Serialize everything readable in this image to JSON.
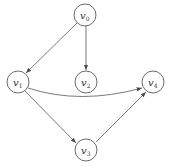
{
  "diagram": {
    "type": "directed-graph",
    "nodes": [
      {
        "id": "v0",
        "base": "v",
        "sub": "0",
        "cx": 85,
        "cy": 15
      },
      {
        "id": "v1",
        "base": "v",
        "sub": "1",
        "cx": 18,
        "cy": 82
      },
      {
        "id": "v2",
        "base": "v",
        "sub": "2",
        "cx": 86,
        "cy": 82
      },
      {
        "id": "v4",
        "base": "v",
        "sub": "4",
        "cx": 153,
        "cy": 82
      },
      {
        "id": "v3",
        "base": "v",
        "sub": "3",
        "cx": 86,
        "cy": 150
      }
    ],
    "edges": [
      {
        "from": "v0",
        "to": "v1"
      },
      {
        "from": "v0",
        "to": "v2"
      },
      {
        "from": "v1",
        "to": "v4",
        "curved": true
      },
      {
        "from": "v1",
        "to": "v3"
      },
      {
        "from": "v3",
        "to": "v4"
      }
    ],
    "colors": {
      "stroke": "#6a6a6a",
      "text": "#333333",
      "background": "#ffffff"
    }
  }
}
